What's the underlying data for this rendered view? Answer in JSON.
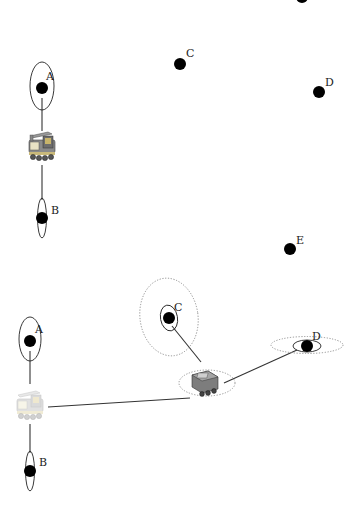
{
  "panels": [
    {
      "name": "top-panel",
      "robot": {
        "x": 42,
        "y": 146,
        "style": "colored"
      },
      "landmarks": [
        {
          "id": "A",
          "label": "A",
          "x": 42,
          "y": 88,
          "r": 6,
          "cov": {
            "rx": 12,
            "ry": 24,
            "style": "solid"
          },
          "connected": true
        },
        {
          "id": "B",
          "label": "B",
          "x": 42,
          "y": 218,
          "r": 6,
          "cov": {
            "rx": 5,
            "ry": 20,
            "style": "solid"
          },
          "connected": true
        },
        {
          "id": "C",
          "label": "C",
          "x": 180,
          "y": 64,
          "r": 6,
          "cov": null,
          "connected": false
        },
        {
          "id": "D",
          "label": "D",
          "x": 319,
          "y": 92,
          "r": 6,
          "cov": null,
          "connected": false
        },
        {
          "id": "E",
          "label": "E",
          "x": 290,
          "y": 249,
          "r": 6,
          "cov": null,
          "connected": false
        },
        {
          "id": "partial",
          "label": "",
          "x": 302,
          "y": -3,
          "r": 6,
          "cov": null,
          "connected": false
        }
      ]
    },
    {
      "name": "bottom-panel",
      "robots": [
        {
          "id": "past-pose",
          "x": 30,
          "y": 407,
          "style": "faded"
        },
        {
          "id": "current-pose",
          "x": 206,
          "y": 383,
          "style": "gray",
          "cov": {
            "rx": 28,
            "ry": 14,
            "style": "dotted"
          }
        }
      ],
      "landmarks": [
        {
          "id": "A",
          "label": "A",
          "x": 30,
          "y": 341,
          "r": 6,
          "cov": {
            "rx": 11,
            "ry": 22,
            "style": "solid"
          }
        },
        {
          "id": "B",
          "label": "B",
          "x": 30,
          "y": 471,
          "r": 6,
          "cov": {
            "rx": 5,
            "ry": 20,
            "style": "solid"
          }
        },
        {
          "id": "C",
          "label": "C",
          "x": 169,
          "y": 318,
          "r": 6,
          "cov": {
            "rx": 9,
            "ry": 13,
            "style": "solid"
          },
          "outer_cov": {
            "rx": 29,
            "ry": 39,
            "style": "dotted"
          }
        },
        {
          "id": "D",
          "label": "D",
          "x": 306,
          "y": 346,
          "r": 6,
          "cov": {
            "rx": 14,
            "ry": 6,
            "style": "solid"
          },
          "outer_cov": {
            "rx": 36,
            "ry": 9,
            "style": "dotted"
          }
        }
      ],
      "edges": [
        {
          "from": "A",
          "to": "past-pose"
        },
        {
          "from": "past-pose",
          "to": "B"
        },
        {
          "from": "past-pose",
          "to": "current-pose"
        },
        {
          "from": "C",
          "to": "current-pose"
        },
        {
          "from": "current-pose",
          "to": "D"
        }
      ]
    }
  ],
  "labels": {
    "top_A": "A",
    "top_B": "B",
    "top_C": "C",
    "top_D": "D",
    "top_E": "E",
    "bot_A": "A",
    "bot_B": "B",
    "bot_C": "C",
    "bot_D": "D"
  },
  "colors": {
    "landmark": "#000000",
    "edge": "#333333",
    "dotted_cov": "#888888",
    "robot_body_colored": "#7a7a7a",
    "robot_accent": "#c8b46a",
    "robot_faded": "#d9d6c8"
  }
}
